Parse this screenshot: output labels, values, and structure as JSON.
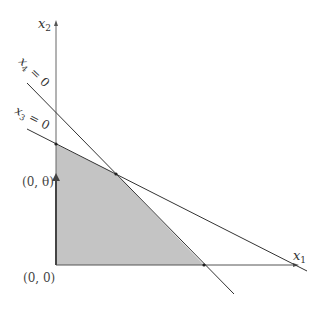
{
  "diagram": {
    "axes": {
      "x_label": "x",
      "x_sub": "1",
      "y_label": "x",
      "y_sub": "2"
    },
    "lines": [
      {
        "name": "x3",
        "label": "x",
        "sub": "3",
        "eq": " = 0"
      },
      {
        "name": "x4",
        "label": "x",
        "sub": "4",
        "eq": " = 0"
      }
    ],
    "points": {
      "origin": "(0, 0)",
      "theta": "(0, θ)"
    },
    "colors": {
      "feasible_region": "#c4c4c4",
      "lines": "#333333",
      "axes": "#555555"
    }
  }
}
